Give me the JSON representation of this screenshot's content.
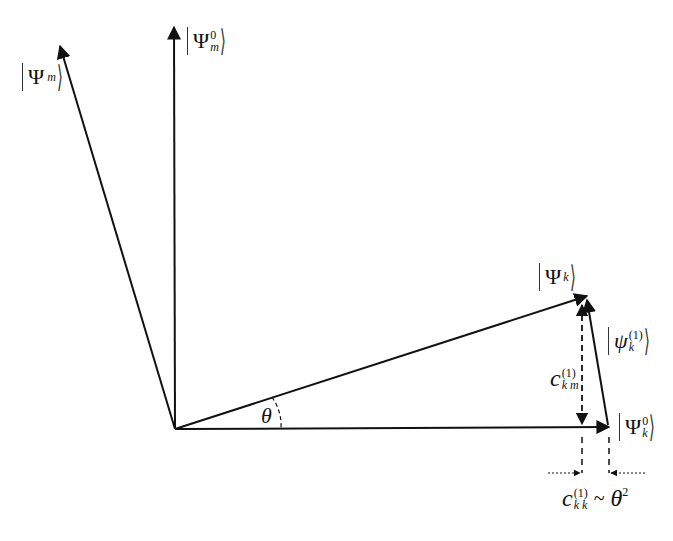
{
  "diagram": {
    "title": "",
    "colors": {
      "line": "#111111",
      "background": "#ffffff"
    },
    "origin": [
      175,
      429
    ],
    "vectors": [
      {
        "id": "psi_m",
        "from": [
          175,
          429
        ],
        "to": [
          58,
          42
        ],
        "label": "|Ψ_m⟩"
      },
      {
        "id": "psi_m0",
        "from": [
          175,
          429
        ],
        "to": [
          174,
          24
        ],
        "label": "|Ψ_m^0⟩"
      },
      {
        "id": "psi_k",
        "from": [
          175,
          429
        ],
        "to": [
          590,
          295
        ],
        "label": "|Ψ_k⟩"
      },
      {
        "id": "psi_k0",
        "from": [
          175,
          429
        ],
        "to": [
          612,
          427
        ],
        "label": "|Ψ_k^0⟩"
      },
      {
        "id": "psi_k1",
        "from": [
          608,
          425
        ],
        "to": [
          586,
          297
        ],
        "label": "|ψ_k^(1)⟩"
      }
    ],
    "labels": {
      "psi_m": {
        "sym": "Ψ",
        "sub": "m"
      },
      "psi_m0": {
        "sym": "Ψ",
        "sup": "0",
        "sub": "m"
      },
      "psi_k": {
        "sym": "Ψ",
        "sub": "k"
      },
      "psi_k0": {
        "sym": "Ψ",
        "sup": "0",
        "sub": "k"
      },
      "psi_k1": {
        "sym": "ψ",
        "sup": "(1)",
        "sub": "k"
      },
      "theta": "θ",
      "c_km": {
        "sym": "c",
        "sup": "(1)",
        "sub": "k m"
      },
      "c_kk": {
        "sym": "c",
        "sup": "(1)",
        "sub": "k k",
        "relation": "~",
        "rhs": "θ",
        "rhs_sup": "2"
      }
    },
    "annotations": [
      "Angle θ between |Ψ_k⟩ and |Ψ_k^0⟩",
      "Vertical dashed double arrow c_km^(1)",
      "Horizontal gap c_kk^(1) ~ θ²"
    ]
  }
}
